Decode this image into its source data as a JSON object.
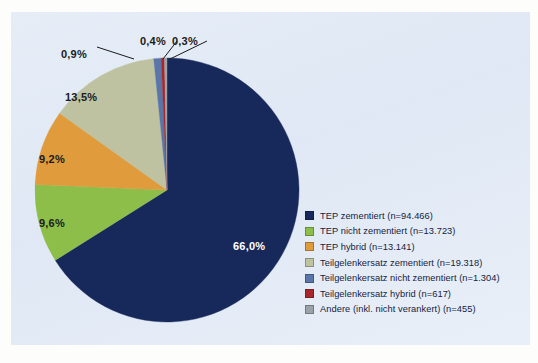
{
  "chart_data": {
    "type": "pie",
    "title": "",
    "subtitle": "",
    "xlabel": "",
    "ylabel": "",
    "legend_position": "right",
    "grid": false,
    "categories": [
      "TEP zementiert (n=94.466)",
      "TEP nicht zementiert (n=13.723)",
      "TEP hybrid (n=13.141)",
      "Teilgelenkersatz zementiert (n=19.318)",
      "Teilgelenkersatz nicht zementiert (n=1.304)",
      "Teilgelenkersatz hybrid (n=617)",
      "Andere (inkl. nicht verankert) (n=455)"
    ],
    "values": [
      66.0,
      9.6,
      9.2,
      13.5,
      0.9,
      0.4,
      0.3
    ],
    "counts": [
      94466,
      13723,
      13141,
      19318,
      1304,
      617,
      455
    ],
    "value_labels": [
      "66,0%",
      "9,6%",
      "9,2%",
      "13,5%",
      "0,9%",
      "0,4%",
      "0,3%"
    ],
    "colors": [
      "#17295a",
      "#8dbe4a",
      "#e09b3d",
      "#bec2a0",
      "#5a76a8",
      "#a8262c",
      "#9aa3a8"
    ]
  },
  "legend": {
    "items": [
      {
        "label": "TEP zementiert (n=94.466)",
        "color": "#17295a"
      },
      {
        "label": "TEP nicht zementiert (n=13.723)",
        "color": "#8dbe4a"
      },
      {
        "label": "TEP hybrid (n=13.141)",
        "color": "#e09b3d"
      },
      {
        "label": "Teilgelenkersatz zementiert (n=19.318)",
        "color": "#bec2a0"
      },
      {
        "label": "Teilgelenkersatz nicht zementiert (n=1.304)",
        "color": "#5a76a8"
      },
      {
        "label": "Teilgelenkersatz hybrid (n=617)",
        "color": "#a8262c"
      },
      {
        "label": "Andere (inkl. nicht verankert) (n=455)",
        "color": "#9aa3a8"
      }
    ]
  },
  "labels": {
    "p66": "66,0%",
    "p96": "9,6%",
    "p92": "9,2%",
    "p135": "13,5%",
    "p09": "0,9%",
    "p04": "0,4%",
    "p03": "0,3%"
  },
  "credit": {
    "text": ""
  }
}
